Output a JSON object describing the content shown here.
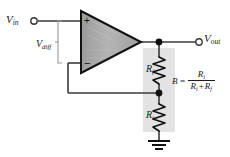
{
  "diagram": {
    "colors": {
      "wire": "#3a3a3a",
      "opamp_fill_light": "#b9b9b9",
      "opamp_fill_dark": "#8f8f8f",
      "opamp_outline": "#111111",
      "shade_box": "#e3e3e3",
      "text": "#1a1a1a",
      "node_dot": "#111111"
    },
    "terminals": {
      "input": {
        "label_main": "V",
        "label_sub": "in",
        "name": "input-terminal"
      },
      "output": {
        "label_main": "V",
        "label_sub": "out",
        "name": "output-terminal"
      }
    },
    "opamp": {
      "noninverting_input_symbol": "+",
      "inverting_input_symbol": "−",
      "differential_label_main": "V",
      "differential_label_sub": "diff"
    },
    "components": [
      {
        "id": "feedback-resistor",
        "label_main": "R",
        "label_sub": "f",
        "type": "resistor"
      },
      {
        "id": "input-resistor",
        "label_main": "R",
        "label_sub": "i",
        "type": "resistor"
      },
      {
        "id": "ground",
        "label_main": "",
        "type": "ground"
      }
    ],
    "formula": {
      "lhs": "B",
      "equals": "=",
      "numerator_main": "R",
      "numerator_sub": "i",
      "denominator_first_main": "R",
      "denominator_first_sub": "i",
      "denominator_operator": "+",
      "denominator_second_main": "R",
      "denominator_second_sub": "f"
    }
  }
}
